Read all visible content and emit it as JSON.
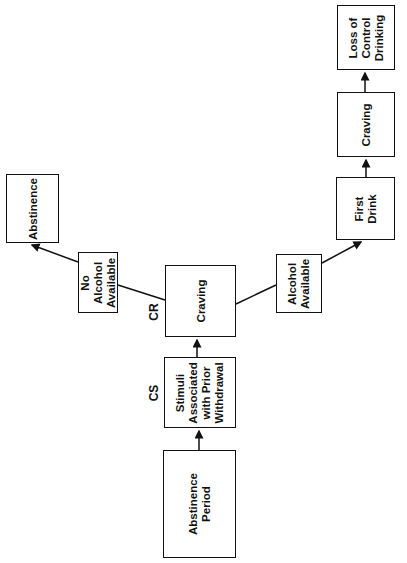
{
  "diagram": {
    "orientation": "rotated-90-ccw",
    "nodes": {
      "abstinence_period": "Abstinence\nPeriod",
      "stimuli": "Stimuli\nAssociated\nwith Prior\nWithdrawal",
      "craving_cr": "Craving",
      "no_alcohol": "No\nAlcohol\nAvailable",
      "abstinence": "Abstinence",
      "alcohol_available": "Alcohol\nAvailable",
      "first_drink": "First\nDrink",
      "craving_2": "Craving",
      "loss_of_control": "Loss of\nControl\nDrinking"
    },
    "tags": {
      "cs": "CS",
      "cr": "CR"
    },
    "edges": [
      {
        "from": "abstinence_period",
        "to": "stimuli",
        "arrow": true
      },
      {
        "from": "stimuli",
        "to": "craving_cr",
        "arrow": true
      },
      {
        "from": "craving_cr",
        "to": "no_alcohol",
        "arrow": false
      },
      {
        "from": "no_alcohol",
        "to": "abstinence",
        "arrow": true
      },
      {
        "from": "craving_cr",
        "to": "alcohol_available",
        "arrow": false
      },
      {
        "from": "alcohol_available",
        "to": "first_drink",
        "arrow": true
      },
      {
        "from": "first_drink",
        "to": "craving_2",
        "arrow": true
      },
      {
        "from": "craving_2",
        "to": "loss_of_control",
        "arrow": true
      }
    ]
  }
}
